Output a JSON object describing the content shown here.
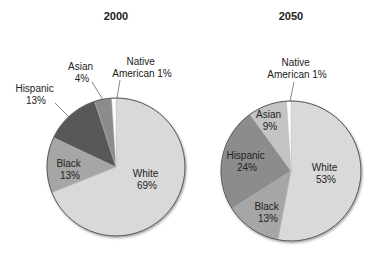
{
  "chart_data": [
    {
      "type": "pie",
      "title": "2000",
      "categories": [
        "White",
        "Black",
        "Hispanic",
        "Asian",
        "Native American"
      ],
      "values": [
        69,
        13,
        13,
        4,
        1
      ],
      "labels": [
        "White\n69%",
        "Black\n13%",
        "Hispanic\n13%",
        "Asian\n4%",
        "Native\nAmerican 1%"
      ],
      "colors": [
        "#d9d9d9",
        "#a6a6a6",
        "#595959",
        "#8c8c8c",
        "#ffffff"
      ]
    },
    {
      "type": "pie",
      "title": "2050",
      "categories": [
        "White",
        "Black",
        "Hispanic",
        "Asian",
        "Native American"
      ],
      "values": [
        53,
        13,
        24,
        9,
        1
      ],
      "labels": [
        "White\n53%",
        "Black\n13%",
        "Hispanic\n24%",
        "Asian\n9%",
        "Native\nAmerican 1%"
      ],
      "colors": [
        "#d9d9d9",
        "#a6a6a6",
        "#8c8c8c",
        "#c4c4c4",
        "#ffffff"
      ]
    }
  ],
  "charts": {
    "left": {
      "title": "2000",
      "white": {
        "name": "White",
        "pct": "69%"
      },
      "black": {
        "name": "Black",
        "pct": "13%"
      },
      "hispanic": {
        "name": "Hispanic",
        "pct": "13%"
      },
      "asian": {
        "name": "Asian",
        "pct": "4%"
      },
      "native": {
        "line1": "Native",
        "line2": "American 1%"
      }
    },
    "right": {
      "title": "2050",
      "white": {
        "name": "White",
        "pct": "53%"
      },
      "black": {
        "name": "Black",
        "pct": "13%"
      },
      "hispanic": {
        "name": "Hispanic",
        "pct": "24%"
      },
      "asian": {
        "name": "Asian",
        "pct": "9%"
      },
      "native": {
        "line1": "Native",
        "line2": "American 1%"
      }
    }
  }
}
